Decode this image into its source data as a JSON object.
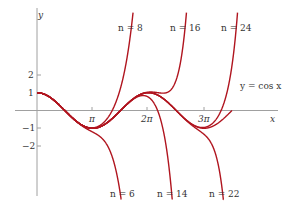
{
  "chart_data": {
    "type": "line",
    "title": "",
    "xlabel": "x",
    "ylabel": "y",
    "x_ticks": [
      "π",
      "2π",
      "3π"
    ],
    "y_ticks": [
      "2",
      "1",
      "−1",
      "−2"
    ],
    "xlim": [
      0,
      11
    ],
    "ylim": [
      -5.5,
      6
    ],
    "grid": false,
    "series": [
      {
        "name": "y = cos x",
        "function": "cos(x)",
        "color": "#b0151f"
      },
      {
        "name": "n = 6",
        "function": "Taylor polynomial of cos x, degree 6, about 0",
        "color": "#b0151f"
      },
      {
        "name": "n = 8",
        "function": "Taylor polynomial of cos x, degree 8, about 0",
        "color": "#b0151f"
      },
      {
        "name": "n = 14",
        "function": "Taylor polynomial of cos x, degree 14, about 0",
        "color": "#b0151f"
      },
      {
        "name": "n = 16",
        "function": "Taylor polynomial of cos x, degree 16, about 0",
        "color": "#b0151f"
      },
      {
        "name": "n = 22",
        "function": "Taylor polynomial of cos x, degree 22, about 0",
        "color": "#b0151f"
      },
      {
        "name": "n = 24",
        "function": "Taylor polynomial of cos x, degree 24, about 0",
        "color": "#b0151f"
      }
    ],
    "annotations": [
      "n = 8",
      "n = 16",
      "n = 24",
      "y = cos x",
      "n = 6",
      "n = 14",
      "n = 22"
    ]
  },
  "labels": {
    "y_axis": "y",
    "x_axis": "x",
    "tick_pi": "π",
    "tick_2pi": "2π",
    "tick_3pi": "3π",
    "tick_y2": "2",
    "tick_y1": "1",
    "tick_ym1": "−1",
    "tick_ym2": "−2",
    "n8": "n = 8",
    "n16": "n = 16",
    "n24": "n = 24",
    "cos": "y = cos x",
    "n6": "n = 6",
    "n14": "n = 14",
    "n22": "n = 22"
  },
  "style": {
    "curve_color": "#b0151f",
    "axis_color": "#999999"
  }
}
